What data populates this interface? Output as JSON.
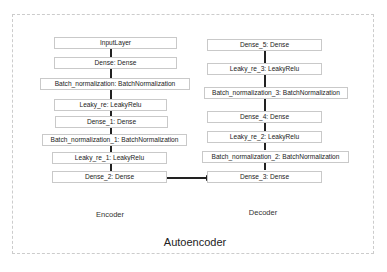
{
  "diagram": {
    "title": "Autoencoder",
    "encoder": {
      "label": "Encoder",
      "layers": [
        "InputLayer",
        "Dense: Dense",
        "Batch_normalization: BatchNormalization",
        "Leaky_re: LeakyRelu",
        "Dense_1: Dense",
        "Batch_normalization_1: BatchNormalization",
        "Leaky_re_1: LeakyRelu",
        "Dense_2: Dense"
      ]
    },
    "decoder": {
      "label": "Decoder",
      "layers": [
        "Dense_5: Dense",
        "Leaky_re_3: LeakyRelu",
        "Batch_normalization_3: BatchNormalization",
        "Dense_4: Dense",
        "Leaky_re_2: LeakyRelu",
        "Batch_normalization_2: BatchNormalization",
        "Dense_3: Dense"
      ]
    },
    "connection": {
      "from": "Dense_2: Dense",
      "to": "Dense_3: Dense"
    }
  }
}
